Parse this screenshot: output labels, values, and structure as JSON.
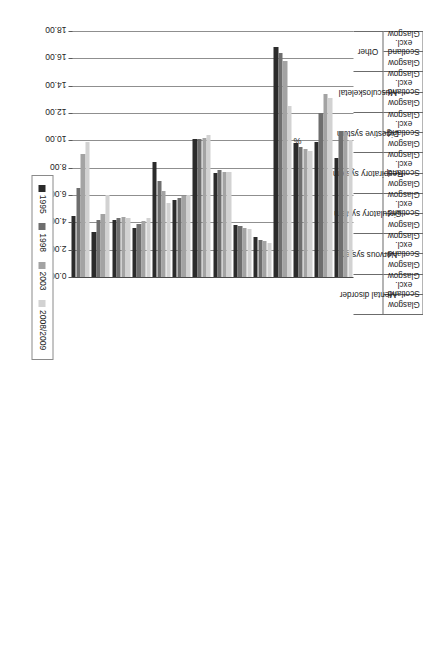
{
  "chart_data": {
    "type": "bar",
    "orientation": "horizontal",
    "title": "",
    "xlabel": "%",
    "ylabel": "",
    "xlim": [
      0,
      18
    ],
    "tick_labels": [
      "18.00",
      "16.00",
      "14.00",
      "12.00",
      "10.00",
      "8.00",
      "6.00",
      "4.00",
      "2.00",
      "0.00"
    ],
    "tick_values": [
      18,
      16,
      14,
      12,
      10,
      8,
      6,
      4,
      2,
      0
    ],
    "grid": true,
    "legend_position": "left-middle",
    "legend": [
      "1995",
      "1998",
      "2003",
      "2008/2009"
    ],
    "series_colors": [
      "#2b2b2b",
      "#6e6e6e",
      "#a3a3a3",
      "#d2d2d2"
    ],
    "conditions": [
      "Mental disorder",
      "Nervous system",
      "Circulatory system",
      "Respiratory system",
      "Digestive system",
      "Musculoskeletal",
      "Other"
    ],
    "areas": [
      "Glasgow",
      "Scotland excl. Glasgow"
    ],
    "categories": [
      "Mental disorder - Glasgow",
      "Mental disorder - Scotland excl. Glasgow",
      "Nervous system - Glasgow",
      "Nervous system - Scotland excl. Glasgow",
      "Circulatory system - Glasgow",
      "Circulatory system - Scotland excl. Glasgow",
      "Respiratory system - Glasgow",
      "Respiratory system - Scotland excl. Glasgow",
      "Digestive system - Glasgow",
      "Digestive system - Scotland excl. Glasgow",
      "Musculoskeletal - Glasgow",
      "Musculoskeletal - Scotland excl. Glasgow",
      "Other - Glasgow",
      "Other - Scotland excl. Glasgow"
    ],
    "series": [
      {
        "name": "1995",
        "values": [
          4.5,
          3.3,
          4.2,
          3.6,
          8.4,
          5.6,
          10.1,
          7.6,
          3.8,
          2.9,
          16.8,
          9.8,
          9.9,
          8.7
        ]
      },
      {
        "name": "1998",
        "values": [
          6.5,
          4.2,
          4.3,
          3.9,
          7.0,
          5.8,
          10.1,
          7.8,
          3.7,
          2.7,
          16.4,
          9.5,
          12.0,
          10.7
        ]
      },
      {
        "name": "2003",
        "values": [
          9.0,
          4.6,
          4.4,
          4.1,
          6.3,
          5.9,
          10.2,
          7.7,
          3.6,
          2.6,
          15.8,
          9.4,
          13.4,
          10.6
        ]
      },
      {
        "name": "2008/2009",
        "values": [
          9.9,
          6.0,
          4.3,
          4.3,
          5.4,
          6.0,
          10.4,
          7.7,
          3.5,
          2.5,
          12.5,
          9.2,
          13.1,
          10.0
        ]
      }
    ]
  },
  "axis": {
    "value_axis_title": "%"
  },
  "legend": {
    "items": [
      {
        "label": "1995",
        "color": "#2b2b2b"
      },
      {
        "label": "1998",
        "color": "#6e6e6e"
      },
      {
        "label": "2003",
        "color": "#a3a3a3"
      },
      {
        "label": "2008/2009",
        "color": "#d2d2d2"
      }
    ]
  }
}
